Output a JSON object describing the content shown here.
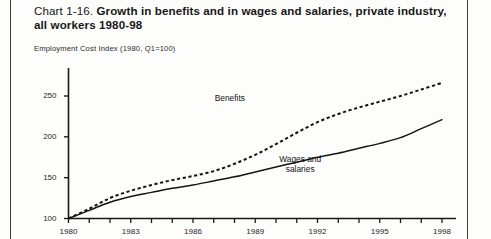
{
  "document": {
    "title_prefix": "Chart 1-16.",
    "title_bold": "Growth in benefits and in wages and salaries, private industry, all workers 1980-98",
    "subtitle": "Employment Cost Index (1980, Q1=100)"
  },
  "labels": {
    "benefits": "Benefits",
    "wages_line1": "Wages and",
    "wages_line2": "salaries"
  },
  "colors": {
    "ink": "#1a1a1a",
    "paper": "#fdfdfc",
    "line": "#141414"
  },
  "chart_data": {
    "type": "line",
    "title": "Chart 1-16. Growth in benefits and in wages and salaries, private industry, all workers 1980-98",
    "subtitle": "Employment Cost Index (1980, Q1=100)",
    "xlabel": "",
    "ylabel": "Employment Cost Index (1980, Q1=100)",
    "xlim": [
      1980,
      1998
    ],
    "ylim": [
      100,
      275
    ],
    "yticks": [
      100,
      150,
      200,
      250
    ],
    "ytick_labels": [
      "100",
      "150",
      "200",
      "250"
    ],
    "xticks": [
      1980,
      1981,
      1982,
      1983,
      1984,
      1985,
      1986,
      1987,
      1988,
      1989,
      1990,
      1991,
      1992,
      1993,
      1994,
      1995,
      1996,
      1997,
      1998
    ],
    "xtick_labels_shown": [
      "1980",
      "1983",
      "1986",
      "1989",
      "1992",
      "1995",
      "1998"
    ],
    "xtick_labels_shown_at": [
      1980,
      1983,
      1986,
      1989,
      1992,
      1995,
      1998
    ],
    "grid": false,
    "legend": "inline-annotations",
    "x": [
      1980,
      1981,
      1982,
      1983,
      1984,
      1985,
      1986,
      1987,
      1988,
      1989,
      1990,
      1991,
      1992,
      1993,
      1994,
      1995,
      1996,
      1997,
      1998
    ],
    "series": [
      {
        "name": "Benefits",
        "style": "dotted",
        "label_position": {
          "x": 1988.2,
          "y": 247
        },
        "values": [
          100,
          112,
          125,
          134,
          141,
          147,
          152,
          158,
          167,
          178,
          191,
          205,
          218,
          228,
          236,
          243,
          250,
          258,
          266
        ]
      },
      {
        "name": "Wages and salaries",
        "style": "solid",
        "label_position": {
          "x": 1991.5,
          "y": 172
        },
        "values": [
          100,
          110,
          120,
          127,
          132,
          137,
          141,
          146,
          151,
          157,
          163,
          169,
          175,
          180,
          186,
          192,
          199,
          210,
          221
        ]
      }
    ]
  }
}
